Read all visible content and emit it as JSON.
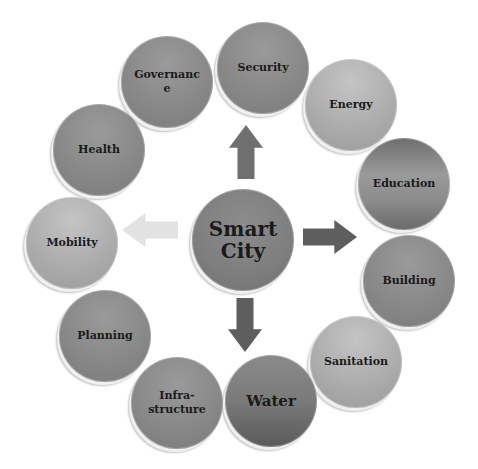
{
  "diagram": {
    "title": "Smart City",
    "center": {
      "label": "Smart City",
      "cx": 243,
      "cy": 240,
      "r": 51,
      "font_size": 20
    },
    "nodes": [
      {
        "id": "security",
        "label": "Security",
        "cx": 263,
        "cy": 68,
        "r": 46,
        "tone": "mid",
        "font_size": 11
      },
      {
        "id": "energy",
        "label": "Energy",
        "cx": 351,
        "cy": 105,
        "r": 46,
        "tone": "light",
        "font_size": 11
      },
      {
        "id": "education",
        "label": "Education",
        "cx": 404,
        "cy": 184,
        "r": 46,
        "tone": "grad",
        "font_size": 11
      },
      {
        "id": "building",
        "label": "Building",
        "cx": 409,
        "cy": 281,
        "r": 46,
        "tone": "mid",
        "font_size": 11
      },
      {
        "id": "sanitation",
        "label": "Sanitation",
        "cx": 356,
        "cy": 362,
        "r": 46,
        "tone": "light",
        "font_size": 11
      },
      {
        "id": "water",
        "label": "Water",
        "cx": 271,
        "cy": 401,
        "r": 46,
        "tone": "dark",
        "font_size": 15
      },
      {
        "id": "infrastructure",
        "label": "Infra-\nstructure",
        "cx": 177,
        "cy": 403,
        "r": 46,
        "tone": "mid",
        "font_size": 11
      },
      {
        "id": "planning",
        "label": "Planning",
        "cx": 105,
        "cy": 336,
        "r": 46,
        "tone": "mid",
        "font_size": 11
      },
      {
        "id": "mobility",
        "label": "Mobility",
        "cx": 72,
        "cy": 243,
        "r": 46,
        "tone": "light",
        "font_size": 11
      },
      {
        "id": "health",
        "label": "Health",
        "cx": 99,
        "cy": 150,
        "r": 46,
        "tone": "mid",
        "font_size": 11
      },
      {
        "id": "governance",
        "label": "Governanc\ne",
        "cx": 167,
        "cy": 82,
        "r": 46,
        "tone": "mid",
        "font_size": 11
      }
    ],
    "arrows": [
      {
        "id": "up",
        "direction": "up",
        "color": "#6f6f6f",
        "x": 229,
        "y": 125,
        "w": 34,
        "h": 54
      },
      {
        "id": "right",
        "direction": "right",
        "color": "#5e5e5e",
        "x": 303,
        "y": 220,
        "w": 54,
        "h": 34
      },
      {
        "id": "down",
        "direction": "down",
        "color": "#5e5e5e",
        "x": 228,
        "y": 298,
        "w": 34,
        "h": 54
      },
      {
        "id": "left",
        "direction": "left",
        "color": "#e2e2e2",
        "x": 122,
        "y": 213,
        "w": 56,
        "h": 34
      }
    ]
  }
}
